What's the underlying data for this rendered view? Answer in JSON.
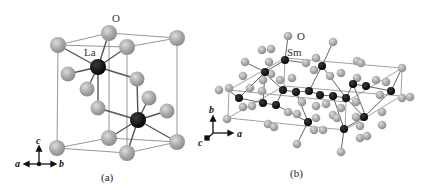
{
  "figure": {
    "panel_a": {
      "caption": "(a)",
      "atom_labels": {
        "oxygen": "O",
        "metal": "La"
      },
      "axes": {
        "up": "c",
        "left": "a",
        "right": "b"
      }
    },
    "panel_b": {
      "caption": "(b)",
      "atom_labels": {
        "oxygen": "O",
        "metal": "Sm"
      },
      "axes": {
        "up": "b",
        "right": "a",
        "out": "c"
      }
    },
    "colors": {
      "oxygen_atom": "#a9a9a9",
      "oxygen_highlight": "#d8d8d8",
      "metal_atom": "#111111",
      "bond": "#555555",
      "cell_edge": "#8a8a8a",
      "background": "#ffffff"
    }
  }
}
